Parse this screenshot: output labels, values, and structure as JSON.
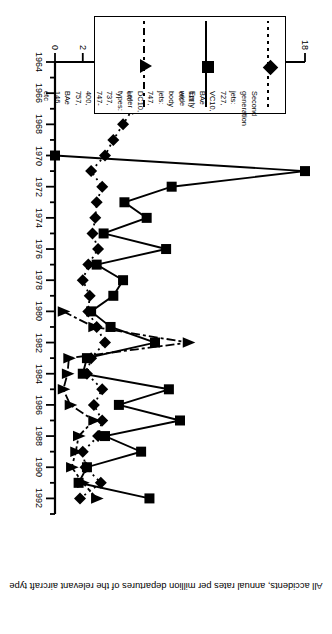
{
  "chart_data": {
    "type": "line",
    "title": "",
    "xlabel": "",
    "ylabel": "All accidents, annual rates per million departures of the relevant aircraft type",
    "orientation": "rotated-180",
    "grid": false,
    "legend_position": "top-left",
    "xlim": [
      1964,
      1993
    ],
    "ylim": [
      0,
      18
    ],
    "x_tick_labels": [
      "1964",
      "1966",
      "1968",
      "1970",
      "1972",
      "1974",
      "1976",
      "1978",
      "1980",
      "1982",
      "1984",
      "1986",
      "1988",
      "1990",
      "1992"
    ],
    "x_tick_values": [
      1964,
      1966,
      1968,
      1970,
      1972,
      1974,
      1976,
      1978,
      1980,
      1982,
      1984,
      1986,
      1988,
      1990,
      1992
    ],
    "x_minor_step": 1,
    "y_tick_labels": [
      "0",
      "2",
      "4",
      "6",
      "8",
      "10",
      "12",
      "14",
      "16",
      "18"
    ],
    "y_tick_values": [
      0,
      2,
      4,
      6,
      8,
      10,
      12,
      14,
      16,
      18
    ],
    "series": [
      {
        "name": "Second generation jets: 727, VC10, BAe 111, etc",
        "marker": "diamond",
        "line": "dotted",
        "x": [
          1964,
          1965,
          1966,
          1967,
          1968,
          1969,
          1970,
          1971,
          1972,
          1973,
          1974,
          1975,
          1976,
          1977,
          1978,
          1979,
          1980,
          1981,
          1982,
          1983,
          1984,
          1985,
          1986,
          1987,
          1988,
          1989,
          1990,
          1991,
          1992
        ],
        "values": [
          7.0,
          14.5,
          8.0,
          5.6,
          4.9,
          4.2,
          3.6,
          2.6,
          3.4,
          3.0,
          2.9,
          2.7,
          3.1,
          2.4,
          2.0,
          2.5,
          2.4,
          3.0,
          3.6,
          2.6,
          2.3,
          3.4,
          2.8,
          3.4,
          3.1,
          2.0,
          2.2,
          3.3,
          1.8
        ]
      },
      {
        "name": "Early wide body jets: 747, DC10, etc",
        "marker": "square",
        "line": "solid",
        "x": [
          1970,
          1971,
          1972,
          1973,
          1974,
          1975,
          1976,
          1977,
          1978,
          1979,
          1980,
          1981,
          1982,
          1983,
          1984,
          1985,
          1986,
          1987,
          1988,
          1989,
          1990,
          1991,
          1992
        ],
        "values": [
          0.0,
          18.0,
          8.4,
          5.0,
          6.6,
          3.5,
          8.0,
          3.0,
          4.9,
          4.2,
          2.6,
          4.0,
          7.2,
          2.3,
          2.0,
          8.2,
          4.6,
          9.0,
          3.6,
          6.2,
          2.3,
          1.7,
          6.8
        ]
      },
      {
        "name": "Later types: 737, 747-400, 757, BAe 146, etc",
        "marker": "triangle",
        "line": "dash-dot",
        "x": [
          1980,
          1981,
          1982,
          1983,
          1984,
          1985,
          1986,
          1987,
          1988,
          1989,
          1990,
          1991,
          1992
        ],
        "values": [
          0.6,
          2.8,
          9.6,
          1.0,
          0.9,
          0.6,
          1.1,
          2.8,
          1.7,
          1.5,
          1.2,
          2.0,
          3.0
        ]
      }
    ]
  },
  "legend": {
    "entries": [
      {
        "label": "Second\ngeneration\njets: 727,\nVC10, BAe\n111, etc",
        "marker": "diamond",
        "line": "dotted"
      },
      {
        "label": "Early wide\nbody jets:\n747, DC10,\netc",
        "marker": "square",
        "line": "solid"
      },
      {
        "label": "Later\ntypes: 737,\n747-400,\n757, BAe\n146, etc",
        "marker": "triangle",
        "line": "dash-dot"
      }
    ]
  }
}
